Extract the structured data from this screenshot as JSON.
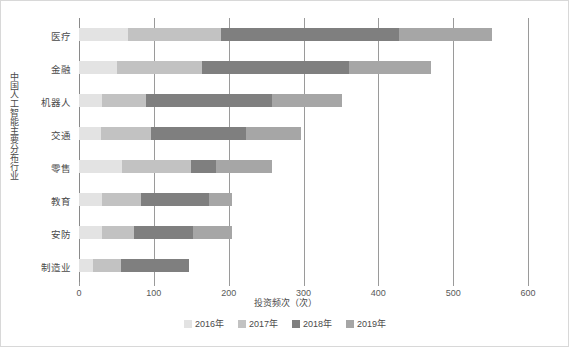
{
  "chart_data": {
    "type": "bar",
    "orientation": "horizontal",
    "stacked": true,
    "title": "",
    "xlabel": "投资频次（次）",
    "ylabel": "中国人工智能主要分布行业",
    "categories": [
      "医疗",
      "金融",
      "机器人",
      "交通",
      "零售",
      "教育",
      "安防",
      "制造业"
    ],
    "series": [
      {
        "name": "2016年",
        "color": "#e3e3e3",
        "values": [
          65,
          51,
          31,
          29,
          57,
          31,
          31,
          19
        ]
      },
      {
        "name": "2017年",
        "color": "#c2c2c2",
        "values": [
          125,
          113,
          59,
          67,
          93,
          52,
          43,
          37
        ]
      },
      {
        "name": "2018年",
        "color": "#7f7f7f",
        "values": [
          238,
          197,
          168,
          127,
          33,
          91,
          78,
          91
        ]
      },
      {
        "name": "2019年",
        "color": "#a6a6a6",
        "values": [
          124,
          109,
          94,
          74,
          75,
          30,
          53,
          0
        ]
      }
    ],
    "totals": [
      552,
      470,
      352,
      297,
      258,
      204,
      205,
      147
    ],
    "xticks": [
      0,
      100,
      200,
      300,
      400,
      500,
      600
    ],
    "xlim": [
      0,
      600
    ],
    "grid": "vertical",
    "legend_position": "bottom"
  },
  "legend": {
    "items": [
      {
        "label": "2016年",
        "color": "#e3e3e3"
      },
      {
        "label": "2017年",
        "color": "#c2c2c2"
      },
      {
        "label": "2018年",
        "color": "#7f7f7f"
      },
      {
        "label": "2019年",
        "color": "#a6a6a6"
      }
    ]
  },
  "axis": {
    "x_title": "投资频次（次）",
    "y_title": "中国人工智能主要分布行业",
    "tick_labels": [
      "0",
      "100",
      "200",
      "300",
      "400",
      "500",
      "600"
    ]
  }
}
